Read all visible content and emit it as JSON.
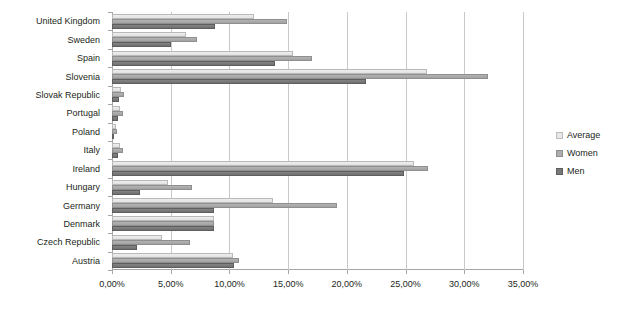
{
  "chart_data": {
    "type": "bar",
    "orientation": "horizontal",
    "title": "",
    "xlabel": "",
    "ylabel": "",
    "xlim": [
      0,
      35
    ],
    "xticks": [
      0,
      5,
      10,
      15,
      20,
      25,
      30,
      35
    ],
    "xtick_labels": [
      "0,00%",
      "5,00%",
      "10,00%",
      "15,00%",
      "20,00%",
      "25,00%",
      "30,00%",
      "35,00%"
    ],
    "grid": true,
    "legend_position": "right",
    "categories": [
      "United Kingdom",
      "Sweden",
      "Spain",
      "Slovenia",
      "Slovak Republic",
      "Portugal",
      "Poland",
      "Italy",
      "Ireland",
      "Hungary",
      "Germany",
      "Denmark",
      "Czech Republic",
      "Austria"
    ],
    "series": [
      {
        "name": "Average",
        "color": "#e8e8e8",
        "values": [
          12.1,
          6.3,
          15.4,
          26.8,
          0.8,
          0.7,
          0.3,
          0.7,
          25.7,
          4.8,
          13.7,
          8.7,
          4.3,
          10.3
        ]
      },
      {
        "name": "Women",
        "color": "#adadad",
        "values": [
          14.9,
          7.2,
          17.0,
          32.0,
          1.0,
          0.9,
          0.4,
          0.9,
          26.9,
          6.8,
          19.2,
          8.7,
          6.6,
          10.8
        ]
      },
      {
        "name": "Men",
        "color": "#787878",
        "values": [
          8.8,
          5.0,
          13.9,
          21.6,
          0.6,
          0.5,
          0.2,
          0.5,
          24.9,
          2.4,
          8.7,
          8.7,
          2.1,
          10.4
        ]
      }
    ]
  },
  "legend": {
    "items": [
      {
        "label": "Average",
        "swatch": "avg"
      },
      {
        "label": "Women",
        "swatch": "women"
      },
      {
        "label": "Men",
        "swatch": "men"
      }
    ]
  }
}
